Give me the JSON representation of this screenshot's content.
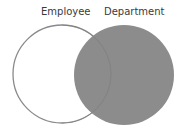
{
  "diagram": {
    "type": "venn",
    "sets": [
      {
        "label": "Employee",
        "highlighted": false
      },
      {
        "label": "Department",
        "highlighted": true
      }
    ],
    "colors": {
      "fill": "#8c8c8c",
      "stroke": "#8a8a8a",
      "background": "#ffffff"
    }
  }
}
